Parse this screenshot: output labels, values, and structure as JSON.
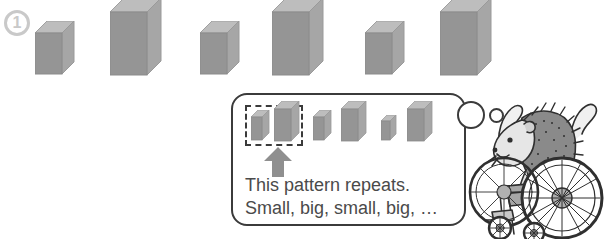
{
  "page": {
    "width": 608,
    "height": 239,
    "background": "#ffffff"
  },
  "question": {
    "number": "1",
    "badge_name": "question-number-badge",
    "badge_color": "#c9c9c9"
  },
  "colors": {
    "block_front": "#959595",
    "block_top": "#bdbdbd",
    "block_side": "#a6a6a6",
    "outline": "#3b3b3b",
    "text": "#4a4a4a"
  },
  "main_pattern": {
    "label": "alternating small and big cuboid blocks",
    "blocks": [
      {
        "size": "small",
        "label": "small"
      },
      {
        "size": "big",
        "label": "big"
      },
      {
        "size": "small",
        "label": "small"
      },
      {
        "size": "big",
        "label": "big"
      },
      {
        "size": "small",
        "label": "small"
      },
      {
        "size": "big",
        "label": "big"
      }
    ]
  },
  "callout": {
    "mini_pattern": {
      "blocks": [
        {
          "size": "small",
          "label": "small",
          "highlighted": true
        },
        {
          "size": "big",
          "label": "big",
          "highlighted": true
        },
        {
          "size": "small",
          "label": "small",
          "highlighted": false
        },
        {
          "size": "big",
          "label": "big",
          "highlighted": false
        },
        {
          "size": "small",
          "label": "small",
          "highlighted": false
        },
        {
          "size": "big",
          "label": "big",
          "highlighted": false
        }
      ]
    },
    "lines": [
      "This pattern repeats.",
      "Small, big, small, big, …"
    ],
    "line1": "This pattern repeats.",
    "line2": "Small, big, small, big, …"
  },
  "mascot": {
    "label": "hedgehog character seated in a wheelchair"
  }
}
